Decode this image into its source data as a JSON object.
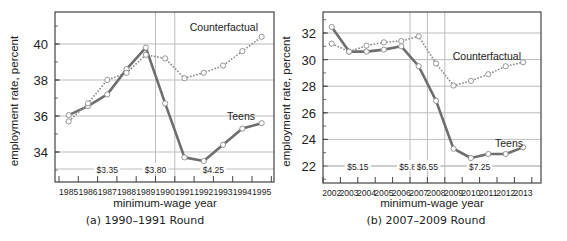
{
  "chart_data": [
    {
      "id": "a",
      "type": "line",
      "caption": "(a) 1990–1991 Round",
      "xlabel": "minimum-wage year",
      "ylabel": "employment rate, percent",
      "categories": [
        "1985",
        "1986",
        "1987",
        "1988",
        "1989",
        "1990",
        "1991",
        "1992",
        "1993",
        "1994",
        "1995"
      ],
      "yticks": [
        34,
        36,
        38,
        40
      ],
      "ylim": [
        32.6,
        41.8
      ],
      "grid": "horizontal",
      "series": [
        {
          "name": "Teens",
          "style": "solid",
          "values": [
            36.05,
            36.55,
            37.2,
            38.6,
            39.8,
            36.7,
            33.7,
            33.5,
            34.4,
            35.3,
            35.6
          ]
        },
        {
          "name": "Counterfactual",
          "style": "dotted",
          "values": [
            35.7,
            36.7,
            38.0,
            38.4,
            39.4,
            39.2,
            38.1,
            38.4,
            38.8,
            39.6,
            40.4
          ]
        }
      ],
      "annotations": {
        "wage_levels": [
          {
            "label": "$3.35",
            "year_index": 2.5
          },
          {
            "label": "$3.80",
            "year_index": 5.0
          },
          {
            "label": "$4.25",
            "year_index": 8.0
          }
        ],
        "vertical_lines_after_index": [
          4,
          5
        ],
        "series_labels": [
          {
            "text": "Counterfactual",
            "x": 258,
            "y": 31
          },
          {
            "text": "Teens",
            "x": 255,
            "y": 120
          }
        ]
      }
    },
    {
      "id": "b",
      "type": "line",
      "caption": "(b) 2007–2009 Round",
      "xlabel": "minimum-wage year",
      "ylabel": "employment rate, percent",
      "categories": [
        "2002",
        "2003",
        "2004",
        "2005",
        "2006",
        "2007",
        "2008",
        "2009",
        "2010",
        "2011",
        "2012",
        "2013"
      ],
      "yticks": [
        22,
        24,
        26,
        28,
        30,
        32
      ],
      "ylim": [
        20.8,
        33.6
      ],
      "grid": "horizontal",
      "series": [
        {
          "name": "Teens",
          "style": "solid",
          "values": [
            32.45,
            30.6,
            30.6,
            30.75,
            31.0,
            29.5,
            26.9,
            23.3,
            22.6,
            22.9,
            22.9,
            23.4
          ]
        },
        {
          "name": "Counterfactual",
          "style": "dotted",
          "values": [
            31.2,
            30.6,
            31.05,
            31.3,
            31.4,
            31.75,
            29.7,
            28.05,
            28.4,
            28.9,
            29.5,
            29.8
          ]
        }
      ],
      "annotations": {
        "wage_levels": [
          {
            "label": "$5.15",
            "year_index": 2.0
          },
          {
            "label": "$5.85",
            "year_index": 5.0
          },
          {
            "label": "$6.55",
            "year_index": 6.0
          },
          {
            "label": "$7.25",
            "year_index": 9.0
          }
        ],
        "vertical_lines_after_index": [
          4,
          5,
          6
        ],
        "series_labels": [
          {
            "text": "Counterfactual",
            "x": 521,
            "y": 60
          },
          {
            "text": "Teens",
            "x": 523,
            "y": 147
          }
        ]
      }
    }
  ],
  "colors": {
    "teens_line": "#6e6e6e",
    "counterfactual_line": "#8a8a8a",
    "grid": "#bdbdbd",
    "frame": "#444444",
    "marker_fill": "#ffffff",
    "marker_stroke": "#8a8a8a",
    "text": "#222222"
  }
}
